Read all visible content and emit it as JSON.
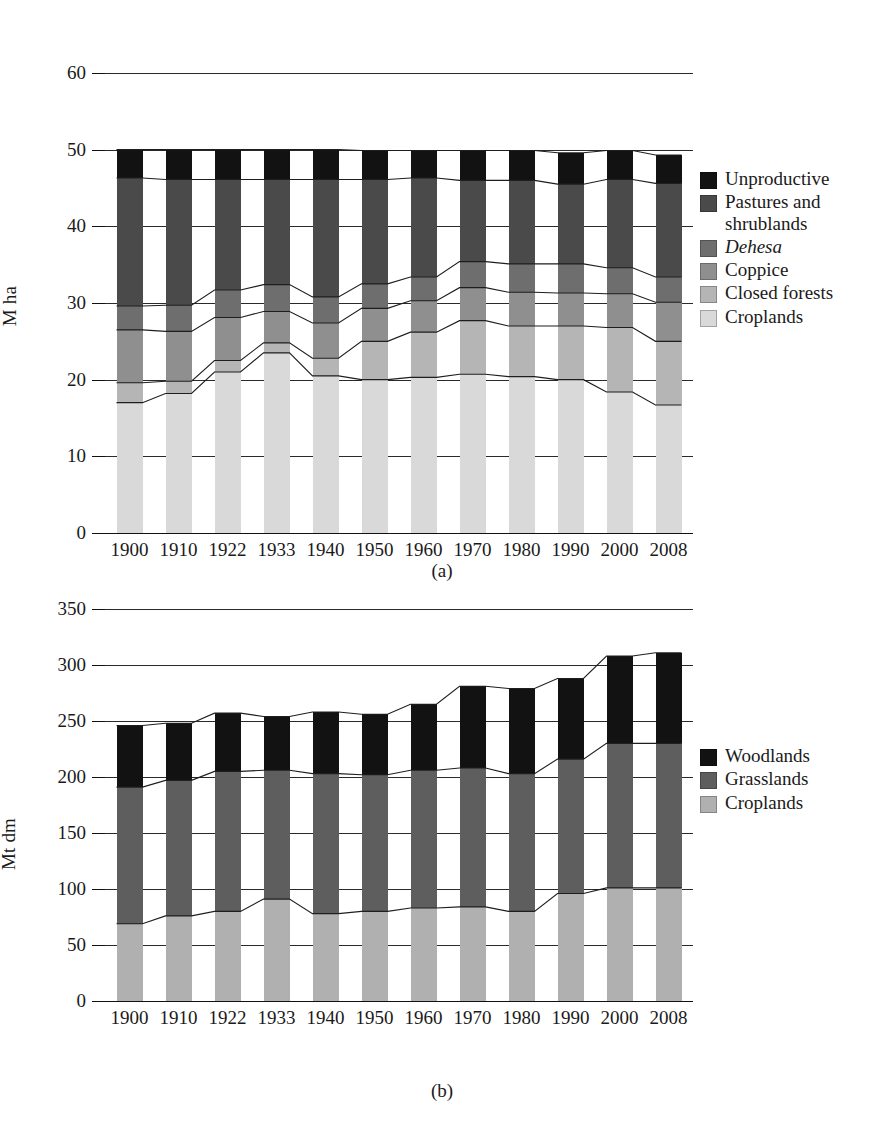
{
  "figure": {
    "panels": [
      {
        "id": "a",
        "caption": "(a)",
        "ylabel": "M ha",
        "yticks": [
          "0",
          "10",
          "20",
          "30",
          "40",
          "50",
          "60"
        ],
        "xticks": [
          "1900",
          "1910",
          "1922",
          "1933",
          "1940",
          "1950",
          "1960",
          "1970",
          "1980",
          "1990",
          "2000",
          "2008"
        ],
        "legend": [
          {
            "label": "Unproductive",
            "color": "#121212",
            "italic": false
          },
          {
            "label": "Pastures and\nshrublands",
            "color": "#4a4a4a",
            "italic": false
          },
          {
            "label": "Dehesa",
            "color": "#6e6e6e",
            "italic": true
          },
          {
            "label": "Coppice",
            "color": "#8f8f8f",
            "italic": false
          },
          {
            "label": "Closed forests",
            "color": "#b5b5b5",
            "italic": false
          },
          {
            "label": "Croplands",
            "color": "#d9d9d9",
            "italic": false
          }
        ]
      },
      {
        "id": "b",
        "caption": "(b)",
        "ylabel": "Mt dm",
        "yticks": [
          "0",
          "50",
          "100",
          "150",
          "200",
          "250",
          "300",
          "350"
        ],
        "xticks": [
          "1900",
          "1910",
          "1922",
          "1933",
          "1940",
          "1950",
          "1960",
          "1970",
          "1980",
          "1990",
          "2000",
          "2008"
        ],
        "legend": [
          {
            "label": "Woodlands",
            "color": "#121212",
            "italic": false
          },
          {
            "label": "Grasslands",
            "color": "#5e5e5e",
            "italic": false
          },
          {
            "label": "Croplands",
            "color": "#b0b0b0",
            "italic": false
          }
        ]
      }
    ]
  },
  "chart_data": [
    {
      "type": "bar",
      "stacked": true,
      "panel": "a",
      "title": "",
      "xlabel": "",
      "ylabel": "M ha",
      "ylim": [
        0,
        60
      ],
      "yticks": [
        0,
        10,
        20,
        30,
        40,
        50,
        60
      ],
      "grid": true,
      "legend_position": "right",
      "categories": [
        "1900",
        "1910",
        "1922",
        "1933",
        "1940",
        "1950",
        "1960",
        "1970",
        "1980",
        "1990",
        "2000",
        "2008"
      ],
      "series": [
        {
          "name": "Croplands",
          "color": "#d9d9d9",
          "values": [
            17.0,
            18.2,
            21.0,
            23.5,
            20.5,
            20.0,
            20.3,
            20.7,
            20.4,
            20.0,
            18.4,
            16.7
          ]
        },
        {
          "name": "Closed forests",
          "color": "#b5b5b5",
          "values": [
            2.6,
            1.6,
            1.5,
            1.3,
            2.3,
            5.0,
            5.9,
            7.0,
            6.6,
            7.0,
            8.4,
            8.3
          ]
        },
        {
          "name": "Coppice",
          "color": "#8f8f8f",
          "values": [
            6.9,
            6.5,
            5.6,
            4.1,
            4.6,
            4.3,
            4.1,
            4.3,
            4.4,
            4.3,
            4.4,
            5.1
          ]
        },
        {
          "name": "Dehesa",
          "color": "#6e6e6e",
          "values": [
            3.1,
            3.4,
            3.6,
            3.5,
            3.4,
            3.2,
            3.1,
            3.4,
            3.7,
            3.8,
            3.4,
            3.3
          ]
        },
        {
          "name": "Pastures and shrublands",
          "color": "#4a4a4a",
          "values": [
            16.7,
            16.4,
            14.4,
            13.7,
            15.3,
            13.6,
            12.9,
            10.6,
            10.9,
            10.4,
            11.5,
            12.2
          ]
        },
        {
          "name": "Unproductive",
          "color": "#121212",
          "values": [
            3.7,
            3.9,
            3.9,
            3.9,
            3.9,
            3.8,
            3.6,
            3.9,
            3.9,
            4.1,
            3.8,
            3.7
          ]
        }
      ],
      "stack_tops": {
        "Croplands": [
          17.0,
          18.2,
          21.0,
          23.5,
          20.5,
          20.0,
          20.3,
          20.7,
          20.4,
          20.0,
          18.4,
          16.7
        ],
        "Closed forests": [
          19.6,
          19.8,
          22.5,
          24.8,
          22.8,
          25.0,
          26.2,
          27.7,
          27.0,
          27.0,
          26.8,
          25.0
        ],
        "Coppice": [
          26.5,
          26.3,
          28.1,
          28.9,
          27.4,
          29.3,
          30.3,
          32.0,
          31.4,
          31.3,
          31.2,
          30.1
        ],
        "Dehesa": [
          29.6,
          29.7,
          31.7,
          32.4,
          30.8,
          32.5,
          33.4,
          35.4,
          35.1,
          35.1,
          34.6,
          33.4
        ],
        "Pastures and shrublands": [
          46.3,
          46.1,
          46.1,
          46.1,
          46.1,
          46.1,
          46.3,
          46.0,
          46.0,
          45.5,
          46.1,
          45.6
        ],
        "Unproductive": [
          50.0,
          50.0,
          50.0,
          50.0,
          50.0,
          49.9,
          49.9,
          49.9,
          49.9,
          49.6,
          49.9,
          49.3
        ]
      }
    },
    {
      "type": "bar",
      "stacked": true,
      "panel": "b",
      "title": "",
      "xlabel": "",
      "ylabel": "Mt dm",
      "ylim": [
        0,
        350
      ],
      "yticks": [
        0,
        50,
        100,
        150,
        200,
        250,
        300,
        350
      ],
      "grid": true,
      "legend_position": "right",
      "categories": [
        "1900",
        "1910",
        "1922",
        "1933",
        "1940",
        "1950",
        "1960",
        "1970",
        "1980",
        "1990",
        "2000",
        "2008"
      ],
      "series": [
        {
          "name": "Croplands",
          "color": "#b0b0b0",
          "values": [
            69,
            76,
            80,
            91,
            78,
            80,
            83,
            84,
            80,
            96,
            101,
            101
          ]
        },
        {
          "name": "Grasslands",
          "color": "#5e5e5e",
          "values": [
            122,
            121,
            125,
            115,
            125,
            122,
            123,
            124,
            123,
            120,
            129,
            129
          ]
        },
        {
          "name": "Woodlands",
          "color": "#121212",
          "values": [
            55,
            51,
            52,
            48,
            55,
            54,
            59,
            73,
            76,
            72,
            78,
            81
          ]
        }
      ],
      "stack_tops": {
        "Croplands": [
          69,
          76,
          80,
          91,
          78,
          80,
          83,
          84,
          80,
          96,
          101,
          101
        ],
        "Grasslands": [
          191,
          197,
          205,
          206,
          203,
          202,
          206,
          208,
          203,
          216,
          230,
          230
        ],
        "Woodlands": [
          246,
          248,
          257,
          254,
          258,
          256,
          265,
          281,
          279,
          288,
          308,
          311
        ]
      }
    }
  ]
}
